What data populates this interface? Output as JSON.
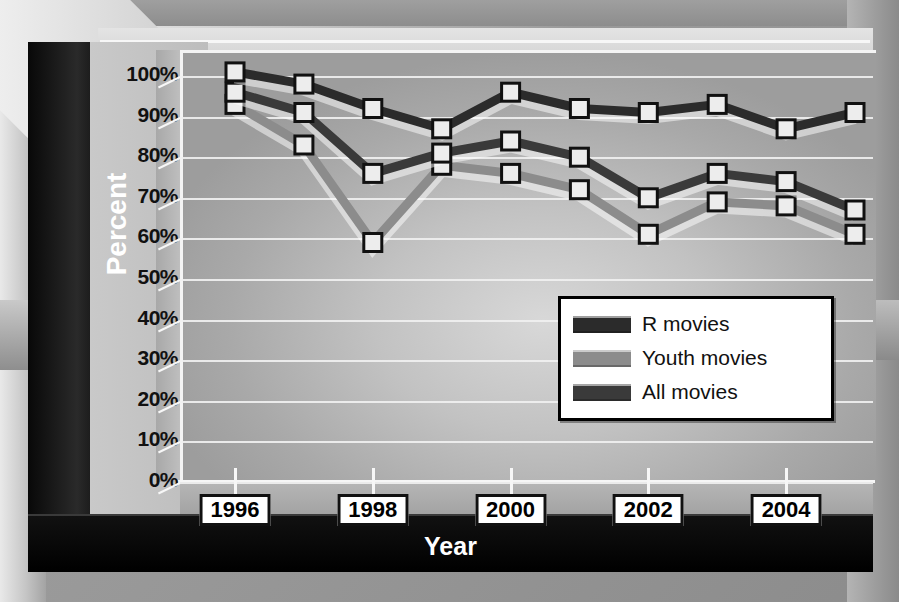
{
  "chart_data": {
    "type": "line",
    "title": "",
    "xlabel": "Year",
    "ylabel": "Percent",
    "x": [
      1996,
      1997,
      1998,
      1999,
      2000,
      2001,
      2002,
      2003,
      2004,
      2005
    ],
    "xtick_labels": [
      "1996",
      "1998",
      "2000",
      "2002",
      "2004"
    ],
    "xtick_values": [
      1996,
      1998,
      2000,
      2002,
      2004
    ],
    "ytick_labels": [
      "0%",
      "10%",
      "20%",
      "30%",
      "40%",
      "50%",
      "60%",
      "70%",
      "80%",
      "90%",
      "100%"
    ],
    "ytick_values": [
      0,
      10,
      20,
      30,
      40,
      50,
      60,
      70,
      80,
      90,
      100
    ],
    "ylim": [
      0,
      100
    ],
    "yunit": "%",
    "grid": true,
    "legend_position": "center-right",
    "series": [
      {
        "name": "R movies",
        "color": "#2b2b2b",
        "values": [
          101,
          98,
          92,
          87,
          96,
          92,
          91,
          93,
          87,
          91
        ]
      },
      {
        "name": "Youth movies",
        "color": "#8c8c8c",
        "values": [
          93,
          83,
          59,
          78,
          76,
          72,
          61,
          69,
          68,
          61
        ]
      },
      {
        "name": "All movies",
        "color": "#3a3a3a",
        "values": [
          96,
          91,
          76,
          81,
          84,
          80,
          70,
          76,
          74,
          67
        ]
      }
    ]
  },
  "marker": {
    "shape": "square",
    "fill": "#ededed",
    "stroke": "#111111"
  },
  "axis_titles": {
    "y": "Percent",
    "x": "Year"
  },
  "legend": {
    "entries": [
      {
        "label": "R movies",
        "color": "#2b2b2b"
      },
      {
        "label": "Youth movies",
        "color": "#8c8c8c"
      },
      {
        "label": "All movies",
        "color": "#3a3a3a"
      }
    ]
  },
  "style": {
    "plot_bg": "#c2c2c2",
    "gridline_color": "#f0f0f0",
    "frame_dark": "#101010",
    "label_text": "#111111",
    "title_text": "#ffffff"
  }
}
